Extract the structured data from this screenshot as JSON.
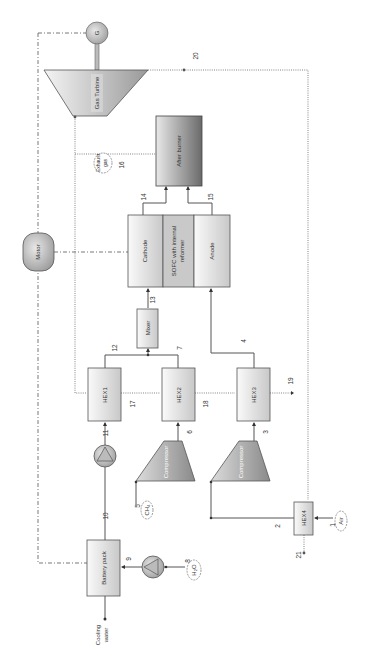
{
  "diagram": {
    "components": {
      "generator": "G",
      "gas_turbine": "Gas Turbine",
      "after_burner": "After burner",
      "exhaust_gas": "Exhaust gas",
      "motor": "Motor",
      "cathode": "Cathode",
      "sofc": "SOFC with internal reformer",
      "sofc_line1": "SOFC with internal",
      "sofc_line2": "reformer",
      "anode": "Anode",
      "mixer": "Mixer",
      "hex1": "HEX1",
      "hex2": "HEX2",
      "hex3": "HEX3",
      "hex4": "HEX4",
      "compressor_fuel": "Compressor",
      "compressor_air": "Compressor",
      "battery_pack": "Battery pack",
      "ch4": "CH₄",
      "air": "Air",
      "h2o": "H₂O",
      "cooling_water_line1": "Cooling",
      "cooling_water_line2": "water"
    },
    "streams": {
      "s1": "1",
      "s2": "2",
      "s3": "3",
      "s4": "4",
      "s5": "5",
      "s6": "6",
      "s7": "7",
      "s8": "8",
      "s9": "9",
      "s10": "10",
      "s11": "11",
      "s12": "12",
      "s13": "13",
      "s14": "14",
      "s15": "15",
      "s16": "16",
      "s17": "17",
      "s18": "18",
      "s19": "19",
      "s20": "20",
      "s21": "21"
    },
    "colors": {
      "line": "#555555",
      "box_fill_light": "#f2f2f2",
      "box_fill_dark": "#bdbdbd",
      "after_burner_dark": "#6e6e6e"
    }
  }
}
